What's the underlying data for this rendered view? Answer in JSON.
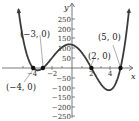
{
  "chart_data": {
    "type": "line",
    "title": "",
    "xlabel": "x",
    "ylabel": "y",
    "function": "f(x) = (x+4)(x+3)(x-2)(x-5)",
    "x_ticks": [
      -4,
      -2,
      2,
      4
    ],
    "x_tick_labels": [
      "-4",
      "-2",
      "2",
      "4"
    ],
    "y_ticks": [
      250,
      200,
      150,
      100,
      50,
      -50,
      -100,
      -150,
      -200,
      -250
    ],
    "y_tick_labels": [
      "250",
      "200",
      "150",
      "100",
      "50",
      "−50",
      "−100",
      "−150",
      "−200",
      "−250"
    ],
    "xlim": [
      -6.5,
      6.5
    ],
    "ylim": [
      -260,
      300
    ],
    "grid": false,
    "zeros": [
      {
        "x": -4,
        "y": 0,
        "label": "(−4, 0)"
      },
      {
        "x": -3,
        "y": 0,
        "label": "(−3, 0)"
      },
      {
        "x": 2,
        "y": 0,
        "label": "(2, 0)"
      },
      {
        "x": 5,
        "y": 0,
        "label": "(5, 0)"
      }
    ],
    "y_intercept": 120
  },
  "labels": {
    "x_axis": "x",
    "y_axis": "y",
    "pt_m4": "(−4, 0)",
    "pt_m3": "(−3, 0)",
    "pt_2": "(2, 0)",
    "pt_5": "(5, 0)",
    "t250": "250",
    "t200": "200",
    "t150": "150",
    "t100": "100",
    "t50": "50",
    "tm50": "−50",
    "tm100": "−100",
    "tm150": "−150",
    "tm200": "−200",
    "tm250": "−250",
    "xm4": "−4",
    "xm2": "−2",
    "x2": "2",
    "x4": "4"
  }
}
